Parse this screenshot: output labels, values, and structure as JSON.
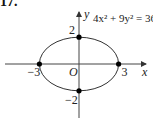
{
  "problem_number": "17.",
  "chart_data": {
    "type": "line",
    "title": "",
    "equation": "4x² + 9y² = 36",
    "curve": "ellipse",
    "center": [
      0,
      0
    ],
    "semi_axis_x": 3,
    "semi_axis_y": 2,
    "xlabel": "x",
    "ylabel": "y",
    "origin_label": "O",
    "xlim": [
      -3.8,
      3.5
    ],
    "ylim": [
      -2.5,
      2.5
    ],
    "grid": false,
    "points": [
      {
        "x": -3,
        "y": 0,
        "label": "−3"
      },
      {
        "x": 3,
        "y": 0,
        "label": "3"
      },
      {
        "x": 0,
        "y": 2,
        "label": "2"
      },
      {
        "x": 0,
        "y": -2,
        "label": "−2"
      }
    ],
    "line_color": "#333333",
    "point_color": "#000000"
  }
}
